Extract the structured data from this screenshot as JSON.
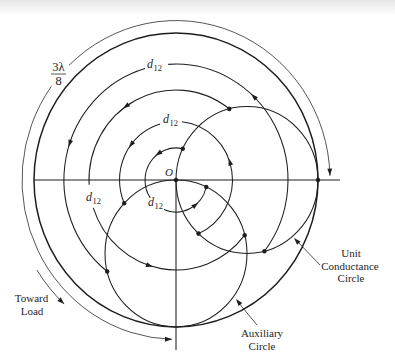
{
  "colors": {
    "ink": "#1e1e1e",
    "background": "#ffffff"
  },
  "figure": {
    "origin_label": "O",
    "rotation_label": {
      "numerator": "3λ",
      "denominator": "8"
    },
    "distance_labels": [
      {
        "symbol": "d",
        "subscript": "12"
      },
      {
        "symbol": "d",
        "subscript": "12"
      },
      {
        "symbol": "d",
        "subscript": "12"
      },
      {
        "symbol": "d",
        "subscript": "12"
      }
    ],
    "direction_label": {
      "lines": [
        "Toward",
        "Load"
      ]
    },
    "callouts": {
      "unit_conductance_circle": {
        "lines": [
          "Unit",
          "Conductance",
          "Circle"
        ]
      },
      "auxiliary_circle": {
        "lines": [
          "Auxiliary",
          "Circle"
        ]
      }
    }
  },
  "diagram": {
    "circles": [
      "Smith chart boundary",
      "Unit Conductance Circle",
      "Auxiliary Circle"
    ],
    "rotation_arcs": 4,
    "rotation_arc_label": "d12",
    "rotation_arrow_direction": "counterclockwise (toward load)",
    "marked_points": 10
  }
}
